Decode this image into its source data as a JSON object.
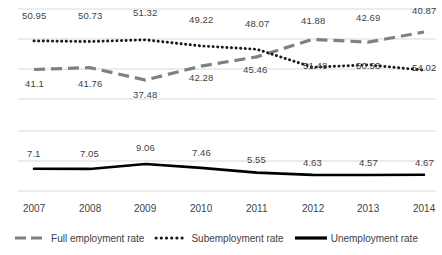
{
  "chart_data": {
    "type": "line",
    "title": "",
    "xlabel": "",
    "ylabel": "",
    "grid": true,
    "legend_position": "bottom",
    "categories": [
      "2007",
      "2008",
      "2009",
      "2010",
      "2011",
      "2012",
      "2013",
      "2014"
    ],
    "panels": [
      {
        "name": "employment-panel",
        "ylim": [
          34,
          56
        ],
        "series": [
          {
            "name": "Full employment rate",
            "style": "dashed",
            "color": "#808080",
            "values": [
              41.1,
              41.76,
              37.48,
              42.28,
              45.46,
              51.48,
              50.53,
              54.02
            ]
          },
          {
            "name": "Subemployment rate",
            "style": "dotted",
            "color": "#1a1a1a",
            "values": [
              50.95,
              50.73,
              51.32,
              49.22,
              48.07,
              41.88,
              42.69,
              40.87
            ]
          }
        ]
      },
      {
        "name": "unemployment-panel",
        "ylim": [
          3.0,
          10.0
        ],
        "series": [
          {
            "name": "Unemployment rate",
            "style": "solid",
            "color": "#000000",
            "values": [
              7.1,
              7.05,
              9.06,
              7.46,
              5.55,
              4.63,
              4.57,
              4.67
            ]
          }
        ]
      }
    ],
    "series": [
      {
        "name": "Full employment rate",
        "values": [
          41.1,
          41.76,
          37.48,
          42.28,
          45.46,
          51.48,
          50.53,
          54.02
        ]
      },
      {
        "name": "Subemployment rate",
        "values": [
          50.95,
          50.73,
          51.32,
          49.22,
          48.07,
          41.88,
          42.69,
          40.87
        ]
      },
      {
        "name": "Unemployment rate",
        "values": [
          7.1,
          7.05,
          9.06,
          7.46,
          5.55,
          4.63,
          4.57,
          4.67
        ]
      }
    ]
  },
  "labels": {
    "full_employment": [
      "41.1",
      "41.76",
      "37.48",
      "42.28",
      "45.46",
      "51.48",
      "50.53",
      "54.02"
    ],
    "subemployment": [
      "50.95",
      "50.73",
      "51.32",
      "49.22",
      "48.07",
      "41.88",
      "42.69",
      "40.87"
    ],
    "unemployment": [
      "7.1",
      "7.05",
      "9.06",
      "7.46",
      "5.55",
      "4.63",
      "4.57",
      "4.67"
    ]
  },
  "xaxis": {
    "ticks": [
      "2007",
      "2008",
      "2009",
      "2010",
      "2011",
      "2012",
      "2013",
      "2014"
    ]
  },
  "legend": {
    "entries": [
      {
        "label": "Full employment rate",
        "marker": "dashed-line-icon",
        "color": "#808080"
      },
      {
        "label": "Subemployment rate",
        "marker": "dotted-line-icon",
        "color": "#1a1a1a"
      },
      {
        "label": "Unemployment rate",
        "marker": "solid-line-icon",
        "color": "#000000"
      }
    ]
  },
  "colors": {
    "gridline": "#d9d9d9",
    "full_employment": "#808080",
    "subemployment": "#1a1a1a",
    "unemployment": "#000000",
    "text": "#3f3f3f",
    "background": "#ffffff"
  }
}
